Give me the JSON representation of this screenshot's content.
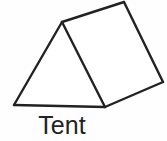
{
  "page": {
    "background_color": "#fefefe",
    "width": 167,
    "height": 141
  },
  "figure": {
    "name": "triangular-prism-tent",
    "caption": "Tent",
    "stroke_color": "#222222",
    "fill_color": "#ffffff",
    "stroke_width": 2.4,
    "vertices": {
      "front_apex": [
        62,
        22
      ],
      "front_bottom_left": [
        14,
        105
      ],
      "front_bottom_right": [
        105,
        107
      ],
      "back_apex": [
        124,
        2
      ],
      "back_bottom_right": [
        163,
        82
      ]
    },
    "faces": [
      {
        "name": "front-triangle-face",
        "points": "62,22 14,105 105,107"
      },
      {
        "name": "side-rectangle-face",
        "points": "62,22 124,2 163,82 105,107"
      }
    ],
    "edges": [
      {
        "name": "front-left-slope-edge",
        "from": [
          62,
          22
        ],
        "to": [
          14,
          105
        ]
      },
      {
        "name": "front-right-slope-edge",
        "from": [
          62,
          22
        ],
        "to": [
          105,
          107
        ]
      },
      {
        "name": "front-base-edge",
        "from": [
          14,
          105
        ],
        "to": [
          105,
          107
        ]
      },
      {
        "name": "ridge-edge",
        "from": [
          62,
          22
        ],
        "to": [
          124,
          2
        ]
      },
      {
        "name": "back-slope-edge",
        "from": [
          124,
          2
        ],
        "to": [
          163,
          82
        ]
      },
      {
        "name": "side-base-edge",
        "from": [
          163,
          82
        ],
        "to": [
          105,
          107
        ]
      }
    ]
  },
  "caption": {
    "text": "Tent",
    "color": "#232323",
    "font_size_px": 25
  }
}
